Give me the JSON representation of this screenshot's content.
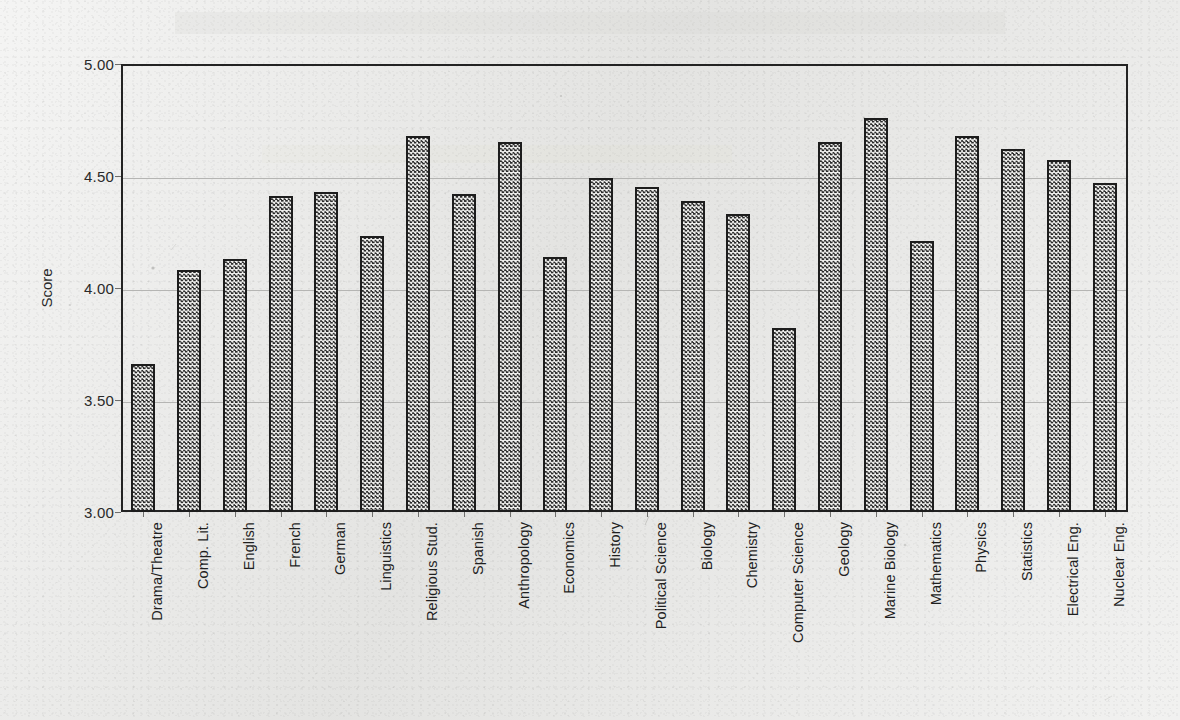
{
  "chart_data": {
    "type": "bar",
    "title": "",
    "subtitle": "",
    "xlabel": "",
    "ylabel": "Score",
    "ylim": [
      3.0,
      5.0
    ],
    "ytick_labels": [
      "5.00",
      "4.50",
      "4.00",
      "3.50",
      "3.00"
    ],
    "ytick_values": [
      5.0,
      4.5,
      4.0,
      3.5,
      3.0
    ],
    "grid": "horizontal",
    "legend": null,
    "legend_position": "none",
    "bar_fill": "checkerboard-hatch",
    "bar_edge_color": "#1d1d1d",
    "categories": [
      "Drama/Theatre",
      "Comp. Lit.",
      "English",
      "French",
      "German",
      "Linguistics",
      "Religious Stud.",
      "Spanish",
      "Anthropology",
      "Economics",
      "History",
      "Political  Science",
      "Biology",
      "Chemistry",
      "Computer Science",
      "Geology",
      "Marine Biology",
      "Mathematics",
      "Physics",
      "Statistics",
      "Electrical Eng.",
      "Nuclear  Eng."
    ],
    "values": [
      3.66,
      4.08,
      4.13,
      4.41,
      4.43,
      4.23,
      4.68,
      4.42,
      4.65,
      4.14,
      4.49,
      4.45,
      4.39,
      4.33,
      3.82,
      4.65,
      4.76,
      4.21,
      4.68,
      4.62,
      4.57,
      4.47
    ]
  },
  "colors": {
    "background": "#e8e8e6",
    "axis": "#232323",
    "grid": "#b5b5b3",
    "text": "#1f1f1f"
  }
}
